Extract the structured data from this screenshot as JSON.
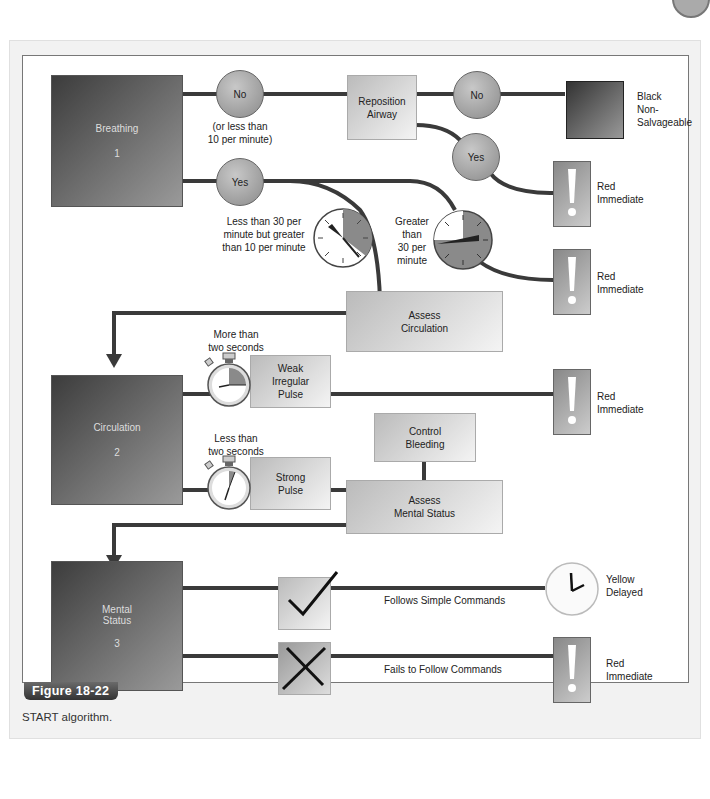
{
  "figure": {
    "label": "Figure 18-22",
    "caption": "START algorithm."
  },
  "categories": {
    "breathing": {
      "name": "Breathing",
      "number": "1"
    },
    "circulation": {
      "name": "Circulation",
      "number": "2"
    },
    "mental_status": {
      "name": "Mental Status",
      "number": "3",
      "line1": "Mental",
      "line2": "Status"
    }
  },
  "decisions": {
    "no1": "No",
    "no1_note_line1": "(or less than",
    "no1_note_line2": "10 per minute)",
    "yes1": "Yes",
    "no2": "No",
    "yes2": "Yes"
  },
  "boxes": {
    "reposition_airway_line1": "Reposition",
    "reposition_airway_line2": "Airway",
    "assess_circulation_line1": "Assess",
    "assess_circulation_line2": "Circulation",
    "weak_pulse_line1": "Weak",
    "weak_pulse_line2": "Irregular",
    "weak_pulse_line3": "Pulse",
    "strong_pulse_line1": "Strong",
    "strong_pulse_line2": "Pulse",
    "control_bleeding_line1": "Control",
    "control_bleeding_line2": "Bleeding",
    "assess_mental_line1": "Assess",
    "assess_mental_line2": "Mental Status"
  },
  "labels": {
    "resp_low_line1": "Less than 30 per",
    "resp_low_line2": "minute but greater",
    "resp_low_line3": "than 10 per minute",
    "resp_high_line1": "Greater",
    "resp_high_line2": "than",
    "resp_high_line3": "30 per",
    "resp_high_line4": "minute",
    "cap_more_line1": "More than",
    "cap_more_line2": "two seconds",
    "cap_less_line1": "Less than",
    "cap_less_line2": "two seconds",
    "follows": "Follows Simple Commands",
    "fails": "Fails to Follow Commands"
  },
  "outcomes": {
    "black_line1": "Black",
    "black_line2": "Non-",
    "black_line3": "Salvageable",
    "red_line1": "Red",
    "red_line2": "Immediate",
    "yellow_line1": "Yellow",
    "yellow_line2": "Delayed"
  },
  "colors": {
    "line": "#3a3a3a",
    "category_dark": "#3c3c3c",
    "category_light": "#9a9a9a"
  }
}
